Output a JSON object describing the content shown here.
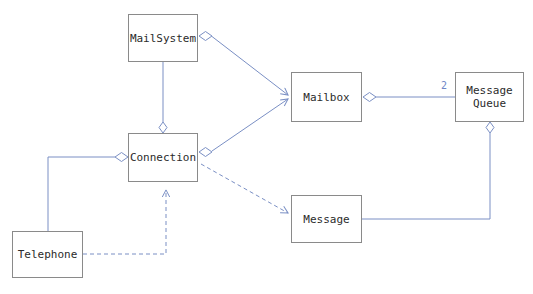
{
  "diagram": {
    "type": "uml-class-diagram",
    "canvas": {
      "width": 533,
      "height": 294,
      "background": "#ffffff"
    },
    "colors": {
      "node_border": "#8a8a8a",
      "node_fill": "#ffffff",
      "node_text": "#2b2b2b",
      "edge": "#7a8fc4",
      "multiplicity_text": "#6f86c6"
    },
    "nodes": [
      {
        "id": "mailsystem",
        "label": "MailSystem",
        "x": 128,
        "y": 14,
        "w": 70,
        "h": 48
      },
      {
        "id": "mailbox",
        "label": "Mailbox",
        "x": 291,
        "y": 72,
        "w": 71,
        "h": 50
      },
      {
        "id": "messagequeue",
        "label": "Message\nQueue",
        "x": 455,
        "y": 72,
        "w": 69,
        "h": 50
      },
      {
        "id": "connection",
        "label": "Connection",
        "x": 128,
        "y": 133,
        "w": 70,
        "h": 49
      },
      {
        "id": "message",
        "label": "Message",
        "x": 291,
        "y": 195,
        "w": 71,
        "h": 48
      },
      {
        "id": "telephone",
        "label": "Telephone",
        "x": 12,
        "y": 231,
        "w": 71,
        "h": 47
      }
    ],
    "edges": [
      {
        "id": "mailsystem-mailbox",
        "from": "mailsystem",
        "to": "mailbox",
        "style": "solid",
        "decoration": "aggregation-diamond-at-source",
        "arrow": "open-arrow-at-target"
      },
      {
        "id": "mailsystem-connection",
        "from": "mailsystem",
        "to": "connection",
        "style": "solid",
        "decoration": "aggregation-diamond-at-target",
        "arrow": "none"
      },
      {
        "id": "connection-mailbox",
        "from": "connection",
        "to": "mailbox",
        "style": "solid",
        "decoration": "aggregation-diamond-at-source",
        "arrow": "open-arrow-at-target"
      },
      {
        "id": "mailbox-messagequeue",
        "from": "mailbox",
        "to": "messagequeue",
        "style": "solid",
        "decoration": "aggregation-diamond-at-source",
        "arrow": "none",
        "multiplicity": "2"
      },
      {
        "id": "messagequeue-message",
        "from": "messagequeue",
        "to": "message",
        "style": "solid",
        "decoration": "aggregation-diamond-at-source",
        "arrow": "none"
      },
      {
        "id": "telephone-connection",
        "from": "telephone",
        "to": "connection",
        "style": "solid",
        "decoration": "aggregation-diamond-at-target",
        "arrow": "none"
      },
      {
        "id": "connection-message",
        "from": "connection",
        "to": "message",
        "style": "dashed",
        "decoration": "none",
        "arrow": "open-arrow-at-target"
      },
      {
        "id": "telephone-connection-dep",
        "from": "telephone",
        "to": "connection",
        "style": "dashed",
        "decoration": "none",
        "arrow": "open-arrow-at-target"
      }
    ],
    "multiplicities": [
      {
        "id": "mailbox-messagequeue-target",
        "value": "2",
        "x": 441,
        "y": 80
      }
    ]
  }
}
